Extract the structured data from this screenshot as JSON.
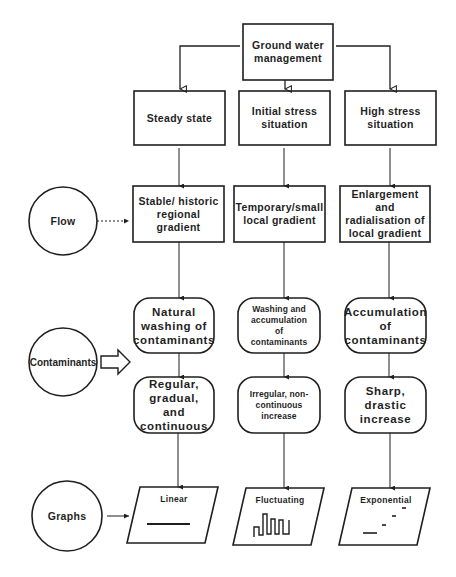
{
  "diagram": {
    "root": {
      "label": "Ground water\nmanagement"
    },
    "states": [
      {
        "label": "Steady state"
      },
      {
        "label": "Initial stress\nsituation"
      },
      {
        "label": "High stress\nsituation"
      }
    ],
    "factors": {
      "flow": {
        "label": "Flow"
      },
      "contaminants": {
        "label": "Contaminants"
      },
      "graphs": {
        "label": "Graphs"
      }
    },
    "gradients": [
      {
        "label": "Stable/ historic\nregional\ngradient"
      },
      {
        "label": "Temporary/small\nlocal gradient"
      },
      {
        "label": "Enlargement\nand\nradialisation of\nlocal gradient"
      }
    ],
    "contaminant_processes": [
      {
        "label": "Natural\nwashing of\ncontaminants"
      },
      {
        "label": "Washing and\naccumulation\nof\ncontaminants"
      },
      {
        "label": "Accumulation\nof\ncontaminants"
      }
    ],
    "trends": [
      {
        "label": "Regular,\ngradual,\nand\ncontinuous"
      },
      {
        "label": "Irregular, non-\ncontinuous\nincrease"
      },
      {
        "label": "Sharp,\ndrastic\nincrease"
      }
    ],
    "graph_types": [
      {
        "label": "Linear",
        "icon": "linear-line-icon"
      },
      {
        "label": "Fluctuating",
        "icon": "fluctuating-wave-icon"
      },
      {
        "label": "Exponential",
        "icon": "exponential-steps-icon"
      }
    ]
  },
  "colors": {
    "stroke": "#1f1f1f",
    "background": "#ffffff"
  }
}
